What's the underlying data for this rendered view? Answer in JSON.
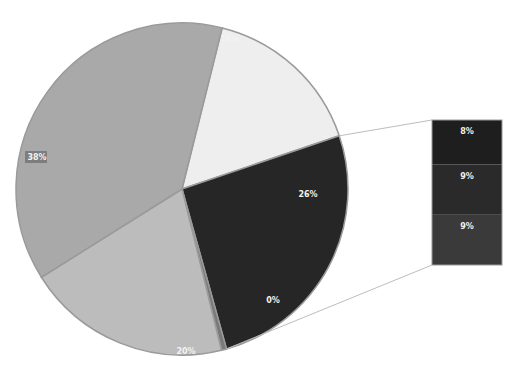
{
  "chart_data": {
    "type": "pie",
    "subtype": "bar-of-pie",
    "title": "",
    "slices": [
      {
        "label": "16%",
        "value": 16,
        "color": "#eeeeee"
      },
      {
        "label": "26%",
        "value": 26,
        "color": "#262626",
        "exploded_into_bar": true
      },
      {
        "label": "0%",
        "value": 0.5,
        "color": "#7a7a7a"
      },
      {
        "label": "20%",
        "value": 20,
        "color": "#bcbcbc"
      },
      {
        "label": "38%",
        "value": 38,
        "color": "#a9a9a9"
      }
    ],
    "secondary_bar": [
      {
        "label": "8%",
        "value": 8,
        "color": "#1e1e1e"
      },
      {
        "label": "9%",
        "value": 9,
        "color": "#2a2a2a"
      },
      {
        "label": "9%",
        "value": 9,
        "color": "#3a3a3a"
      }
    ],
    "legend": "none"
  }
}
